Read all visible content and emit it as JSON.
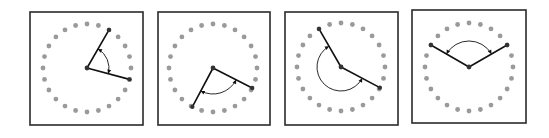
{
  "figure": {
    "dot_count": 24,
    "colors": {
      "frame": "#2a2a2a",
      "dot": "#9a9a9a",
      "arm": "#111111",
      "arc": "#111111"
    },
    "panels": [
      {
        "id": "panel-1",
        "frame": {
          "x": 30,
          "y": 12,
          "w": 113,
          "h": 113
        },
        "center": {
          "x": 87,
          "y": 68
        },
        "radius": 44,
        "arm_angles_deg": [
          -60,
          15
        ],
        "arc": {
          "radius": 22,
          "from_deg": -60,
          "to_deg": 15,
          "sweep": "clockwise"
        }
      },
      {
        "id": "panel-2",
        "frame": {
          "x": 158,
          "y": 12,
          "w": 112,
          "h": 113
        },
        "center": {
          "x": 213,
          "y": 68
        },
        "radius": 44,
        "arm_angles_deg": [
          118,
          27
        ],
        "arc": {
          "radius": 26,
          "from_deg": 118,
          "to_deg": 27,
          "sweep": "counterclockwise"
        }
      },
      {
        "id": "panel-3",
        "frame": {
          "x": 285,
          "y": 12,
          "w": 113,
          "h": 113
        },
        "center": {
          "x": 341,
          "y": 67
        },
        "radius": 44,
        "arm_angles_deg": [
          -120,
          28
        ],
        "arc": {
          "radius": 24,
          "from_deg": -120,
          "to_deg": 28,
          "sweep": "counterclockwise-large"
        }
      },
      {
        "id": "panel-4",
        "frame": {
          "x": 412,
          "y": 10,
          "w": 114,
          "h": 113
        },
        "center": {
          "x": 469,
          "y": 67
        },
        "radius": 44,
        "arm_angles_deg": [
          -150,
          -30
        ],
        "arc": {
          "radius": 26,
          "from_deg": -150,
          "to_deg": -30,
          "sweep": "clockwise"
        }
      }
    ]
  }
}
